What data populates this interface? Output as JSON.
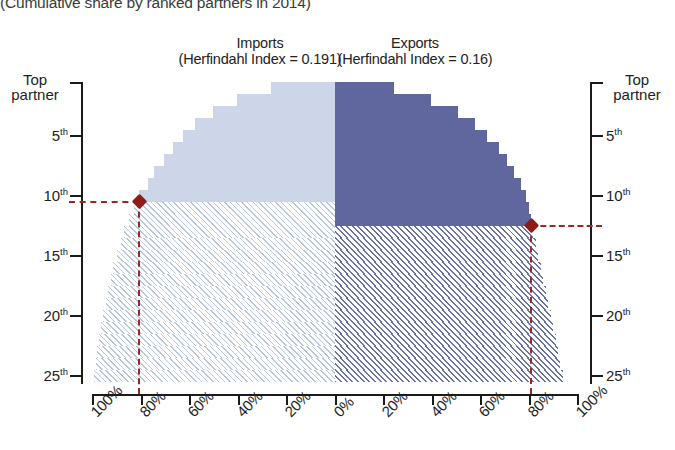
{
  "subtitle": "(Cumulative share by ranked partners in 2014)",
  "panels": {
    "imports": {
      "title": "Imports",
      "index_label": "(Herfindahl Index = 0.191)"
    },
    "exports": {
      "title": "Exports",
      "index_label": "(Herfindahl Index = 0.16)"
    }
  },
  "axes": {
    "y_left_title_line1": "Top",
    "y_left_title_line2": "partner",
    "y_right_title_line1": "Top",
    "y_right_title_line2": "partner",
    "y_ticks": [
      "5",
      "10",
      "15",
      "20",
      "25"
    ],
    "y_tick_suffix": "th",
    "x_ticks": [
      "100%",
      "80%",
      "60%",
      "40%",
      "20%",
      "0%",
      "20%",
      "40%",
      "60%",
      "80%",
      "100%"
    ]
  },
  "markers": {
    "imports": {
      "rank": "10th",
      "share": "80%"
    },
    "exports": {
      "rank": "12th",
      "share": "80%"
    }
  },
  "colors": {
    "imports_fill": "#ccd6e8",
    "exports_fill": "#5f679e",
    "imports_hatch": "#b9c6de",
    "exports_hatch": "#6a73a6",
    "marker": "#8e1d18",
    "axis": "#1a1a1a"
  },
  "chart_data": {
    "type": "bar",
    "title": "(Cumulative share by ranked partners in 2014)",
    "subtype": "back-to-back cumulative tornado",
    "xlabel": "",
    "ylabel": "Partner rank",
    "xlim": [
      -100,
      100
    ],
    "ylim": [
      1,
      25
    ],
    "grid": false,
    "legend": "none",
    "x_tick_labels": [
      "100%",
      "80%",
      "60%",
      "40%",
      "20%",
      "0%",
      "20%",
      "40%",
      "60%",
      "80%",
      "100%"
    ],
    "y_tick_labels": [
      "Top partner",
      "5th",
      "10th",
      "15th",
      "20th",
      "25th"
    ],
    "y_tick_values": [
      1,
      5,
      10,
      15,
      20,
      25
    ],
    "categories": [
      1,
      2,
      3,
      4,
      5,
      6,
      7,
      8,
      9,
      10,
      11,
      12,
      13,
      14,
      15,
      16,
      17,
      18,
      19,
      20,
      21,
      22,
      23,
      24,
      25
    ],
    "annotations": [
      {
        "text": "Imports threshold: 10th partner at 80% cumulative share",
        "x": -80,
        "y": 10
      },
      {
        "text": "Exports threshold: 12th partner at 80% cumulative share",
        "x": 80,
        "y": 12
      }
    ],
    "series": [
      {
        "name": "Imports",
        "direction": "left",
        "herfindahl_index": 0.191,
        "solid_through_rank": 10,
        "values": [
          26,
          40,
          50,
          57,
          62,
          66,
          70,
          74,
          76.5,
          80,
          82,
          84,
          86,
          87.5,
          89,
          90.5,
          91.5,
          92.5,
          93.5,
          94.5,
          95.5,
          96.3,
          97,
          97.7,
          98.5
        ]
      },
      {
        "name": "Exports",
        "direction": "right",
        "herfindahl_index": 0.16,
        "solid_through_rank": 12,
        "values": [
          24,
          39,
          50,
          57,
          62,
          67,
          70,
          73,
          76,
          78,
          79,
          80,
          81,
          82,
          83,
          84,
          85,
          86,
          87,
          88,
          89,
          90,
          91,
          92,
          93
        ]
      }
    ]
  }
}
